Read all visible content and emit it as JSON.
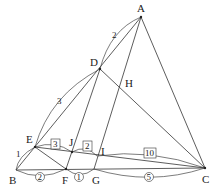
{
  "points": {
    "A": {
      "label": "A",
      "x": 141,
      "y": 17
    },
    "B": {
      "label": "B",
      "x": 16,
      "y": 170
    },
    "C": {
      "label": "C",
      "x": 205,
      "y": 168
    },
    "D": {
      "label": "D",
      "x": 100,
      "y": 69
    },
    "E": {
      "label": "E",
      "x": 35,
      "y": 147
    },
    "F": {
      "label": "F",
      "x": 66,
      "y": 169
    },
    "G": {
      "label": "G",
      "x": 94,
      "y": 169
    },
    "H": {
      "label": "H",
      "x": 122,
      "y": 84
    },
    "I": {
      "label": "I",
      "x": 97,
      "y": 156
    },
    "J": {
      "label": "J",
      "x": 72,
      "y": 152
    }
  },
  "segment_labels": {
    "AD": "2",
    "DE": "3",
    "EB": "1",
    "EJ": "3",
    "JI": "2",
    "IC": "10",
    "BF": "2",
    "FG": "1",
    "GC": "5"
  }
}
